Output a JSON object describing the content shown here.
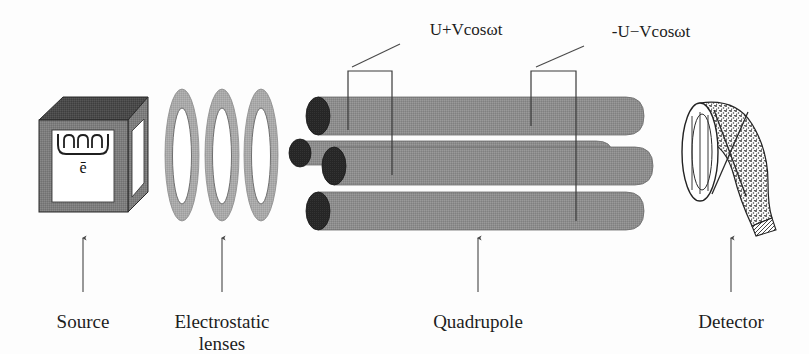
{
  "figure": {
    "background_color": "#fdfdfd"
  },
  "colors": {
    "rod_gray": "#8d8d8d",
    "rod_gray_dark": "#6f6f6f",
    "rod_cap_dark": "#262626",
    "box_front": "#7d7d7d",
    "box_top": "#4a4a4a",
    "box_side": "#6a6a6a",
    "lens_gray": "#a9a9a9",
    "white": "#ffffff",
    "ink": "#1d1d1d",
    "leader": "#4a4a4a"
  },
  "components": [
    {
      "id": "source",
      "label": "Source",
      "label_lines": [
        "Source"
      ],
      "inner_symbol": "ē",
      "pointer": true
    },
    {
      "id": "electrostatic-lenses",
      "label": "Electrostatic lenses",
      "label_lines": [
        "Electrostatic",
        "lenses"
      ],
      "lens_count": 3,
      "pointer": true
    },
    {
      "id": "quadrupole",
      "label": "Quadrupole",
      "label_lines": [
        "Quadrupole"
      ],
      "rod_count": 4,
      "pointer": true
    },
    {
      "id": "detector",
      "label": "Detector",
      "label_lines": [
        "Detector"
      ],
      "pointer": true
    }
  ],
  "voltage_labels": [
    {
      "id": "positive-phase",
      "text": "U+Vcosωt"
    },
    {
      "id": "negative-phase",
      "text": "-U−Vcosωt"
    }
  ]
}
